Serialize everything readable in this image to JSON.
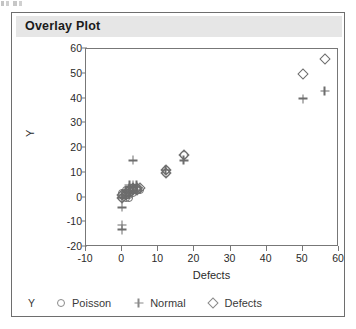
{
  "panel": {
    "title": "Overlay Plot"
  },
  "legend": {
    "role_label": "Y",
    "entries": [
      {
        "marker": "circle-icon",
        "label": "Poisson"
      },
      {
        "marker": "plus-icon",
        "label": "Normal"
      },
      {
        "marker": "diamond-icon",
        "label": "Defects"
      }
    ]
  },
  "chart_data": {
    "type": "scatter",
    "title": "Overlay Plot",
    "xlabel": "Defects",
    "ylabel": "Y",
    "xlim": [
      -10,
      60
    ],
    "ylim": [
      -20,
      60
    ],
    "xticks": [
      -10,
      0,
      10,
      20,
      30,
      40,
      50,
      60
    ],
    "yticks": [
      -20,
      -10,
      0,
      10,
      20,
      30,
      40,
      50,
      60
    ],
    "grid": false,
    "legend_position": "below-plot",
    "marker_color": "#6d6d6d",
    "series": [
      {
        "name": "Poisson",
        "marker": "circle",
        "points": [
          [
            0,
            0
          ],
          [
            0,
            1
          ],
          [
            1,
            1
          ],
          [
            1,
            2
          ],
          [
            1,
            0
          ],
          [
            2,
            2
          ],
          [
            2,
            3
          ],
          [
            2,
            1
          ],
          [
            3,
            3
          ],
          [
            3,
            2
          ],
          [
            3,
            4
          ],
          [
            4,
            3
          ],
          [
            4,
            4
          ],
          [
            5,
            3
          ],
          [
            0,
            2
          ],
          [
            1,
            3
          ],
          [
            2,
            0
          ],
          [
            12,
            11
          ],
          [
            12,
            10
          ],
          [
            17,
            17
          ]
        ]
      },
      {
        "name": "Normal",
        "marker": "plus",
        "points": [
          [
            0,
            -4
          ],
          [
            0,
            -11
          ],
          [
            0,
            -13
          ],
          [
            0,
            0
          ],
          [
            1,
            1
          ],
          [
            1,
            3
          ],
          [
            2,
            2
          ],
          [
            2,
            4
          ],
          [
            3,
            4
          ],
          [
            3,
            5
          ],
          [
            3,
            15
          ],
          [
            4,
            5
          ],
          [
            4,
            3
          ],
          [
            2,
            5
          ],
          [
            12,
            11
          ],
          [
            17,
            15
          ],
          [
            50,
            40
          ],
          [
            56,
            43
          ]
        ]
      },
      {
        "name": "Defects",
        "marker": "diamond",
        "points": [
          [
            0,
            0
          ],
          [
            0,
            1
          ],
          [
            1,
            1
          ],
          [
            1,
            2
          ],
          [
            2,
            2
          ],
          [
            2,
            3
          ],
          [
            3,
            3
          ],
          [
            3,
            4
          ],
          [
            4,
            3
          ],
          [
            4,
            4
          ],
          [
            5,
            4
          ],
          [
            12,
            11
          ],
          [
            12,
            10
          ],
          [
            17,
            17
          ],
          [
            50,
            50
          ],
          [
            56,
            56
          ]
        ]
      }
    ]
  }
}
